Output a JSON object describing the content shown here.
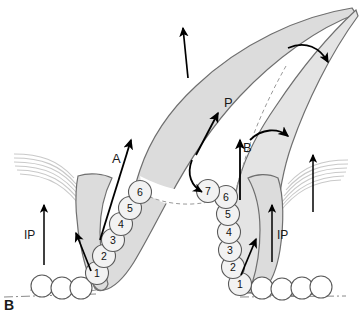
{
  "figure": {
    "panel_label": "B",
    "labels": {
      "anterior": "A",
      "posterior": "P",
      "basal": "B",
      "ip_left": "IP",
      "ip_right": "IP"
    },
    "colors": {
      "tissue_fill": "#dcdcdc",
      "tissue_fill_light": "#e8e8e8",
      "tissue_outline": "#6f6f6f",
      "circle_fill": "#f2f2f2",
      "circle_outline": "#5a5a5a",
      "vesicle_fill": "#ffffff",
      "arrow": "#000000",
      "fiber": "#c9c9c9",
      "dashed": "#9a9a9a",
      "baseline": "#8a8a8a",
      "background": "#ffffff"
    },
    "left_limb": {
      "numbered_circles": [
        {
          "label": "1",
          "cx": 97,
          "cy": 273
        },
        {
          "label": "2",
          "cx": 104,
          "cy": 256
        },
        {
          "label": "3",
          "cx": 113,
          "cy": 240
        },
        {
          "label": "4",
          "cx": 121,
          "cy": 224
        },
        {
          "label": "5",
          "cx": 130,
          "cy": 208
        },
        {
          "label": "6",
          "cx": 140,
          "cy": 192
        }
      ],
      "vesicles": [
        {
          "cx": 42,
          "cy": 286
        },
        {
          "cx": 62,
          "cy": 288
        },
        {
          "cx": 81,
          "cy": 288
        }
      ]
    },
    "right_limb": {
      "numbered_circles": [
        {
          "label": "1",
          "cx": 240,
          "cy": 284
        },
        {
          "label": "2",
          "cx": 233,
          "cy": 267
        },
        {
          "label": "3",
          "cx": 230,
          "cy": 250
        },
        {
          "label": "4",
          "cx": 229,
          "cy": 232
        },
        {
          "label": "5",
          "cx": 228,
          "cy": 214
        },
        {
          "label": "6",
          "cx": 226,
          "cy": 197
        },
        {
          "label": "7",
          "cx": 208,
          "cy": 191
        }
      ],
      "vesicles": [
        {
          "cx": 262,
          "cy": 288
        },
        {
          "cx": 282,
          "cy": 289
        },
        {
          "cx": 302,
          "cy": 288
        },
        {
          "cx": 321,
          "cy": 287
        }
      ]
    },
    "arrows": {
      "top_vertical": "upward arrow over anterior leaflet",
      "top_right_curved": "curved arrow over posterior leaflet tip",
      "anterior_diagonal": "diagonal arrow labeled A",
      "posterior_diagonal": "diagonal arrow labeled P",
      "posterior_curved": "curved recurrent arrow below P",
      "basal_vertical": "vertical arrow labeled B",
      "basal_curved": "curved arrow adjacent to B",
      "ip_left_vertical": "vertical arrow labeled IP on left",
      "ip_right_vertical": "vertical arrow labeled IP on right",
      "ip_right_outer_vertical": "outer vertical arrow on right",
      "left_limb_diagonal": "diagonal arrow inside left limb",
      "right_limb_diagonal": "diagonal arrow inside right limb"
    }
  }
}
